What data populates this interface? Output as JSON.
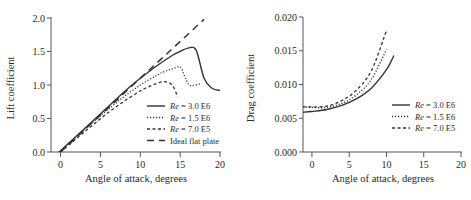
{
  "chart_data": [
    {
      "type": "line",
      "title": "",
      "xlabel": "Angle of attack, degrees",
      "ylabel": "Lift coefficient",
      "xlim": [
        -1.2,
        20
      ],
      "ylim": [
        0,
        2.0
      ],
      "xticks": [
        "0",
        "5",
        "10",
        "15",
        "20"
      ],
      "yticks": [
        "0.0",
        "0.5",
        "1.0",
        "1.5",
        "2.0"
      ],
      "grid": false,
      "legend_position": "lower right",
      "series": [
        {
          "name": "Re = 3.0 E6",
          "name_italic": "Re",
          "name_rest": " = 3.0 E6",
          "style": "solid",
          "x": [
            -1,
            0,
            2,
            4,
            6,
            8,
            10,
            12,
            14,
            15,
            16,
            17,
            18,
            19,
            20
          ],
          "y": [
            -0.1,
            0.02,
            0.24,
            0.46,
            0.68,
            0.9,
            1.1,
            1.28,
            1.44,
            1.5,
            1.55,
            1.52,
            1.1,
            0.95,
            0.92
          ]
        },
        {
          "name": "Re = 1.5 E6",
          "name_italic": "Re",
          "name_rest": " = 1.5 E6",
          "style": "dotted",
          "x": [
            -1,
            0,
            2,
            4,
            6,
            8,
            10,
            12,
            13,
            14,
            15,
            15.5,
            16,
            16.5,
            17.5
          ],
          "y": [
            -0.1,
            0.02,
            0.23,
            0.44,
            0.64,
            0.83,
            1.0,
            1.14,
            1.2,
            1.24,
            1.27,
            1.15,
            1.02,
            0.99,
            1.02
          ]
        },
        {
          "name": "Re = 7.0 E5",
          "name_italic": "Re",
          "name_rest": " = 7.0 E5",
          "style": "short-dashed",
          "x": [
            -1,
            0,
            2,
            4,
            6,
            8,
            10,
            11,
            12,
            13,
            14,
            14.7
          ],
          "y": [
            -0.12,
            0.0,
            0.2,
            0.4,
            0.59,
            0.76,
            0.91,
            0.97,
            1.02,
            1.05,
            1.0,
            0.82
          ]
        },
        {
          "name": "Ideal flat plate",
          "style": "long-dashed",
          "x": [
            0,
            18
          ],
          "y": [
            0.0,
            1.98
          ]
        }
      ]
    },
    {
      "type": "line",
      "title": "",
      "xlabel": "Angle of attack, degrees",
      "ylabel": "Drag coefficient",
      "xlim": [
        -1.2,
        20
      ],
      "ylim": [
        0,
        0.02
      ],
      "xticks": [
        "0",
        "5",
        "10",
        "15",
        "20"
      ],
      "yticks": [
        "0.000",
        "0.005",
        "0.010",
        "0.015",
        "0.020"
      ],
      "grid": false,
      "legend_position": "center right",
      "series": [
        {
          "name": "Re = 3.0 E6",
          "name_italic": "Re",
          "name_rest": " = 3.0 E6",
          "style": "solid",
          "x": [
            -1.2,
            0,
            2,
            4,
            6,
            8,
            10,
            11
          ],
          "y": [
            0.0059,
            0.006,
            0.0063,
            0.0069,
            0.0079,
            0.0095,
            0.0122,
            0.0143
          ]
        },
        {
          "name": "Re = 1.5 E6",
          "name_italic": "Re",
          "name_rest": " = 1.5 E6",
          "style": "dotted",
          "x": [
            -1.2,
            0,
            2,
            4,
            6,
            8,
            10
          ],
          "y": [
            0.0067,
            0.0066,
            0.0066,
            0.0072,
            0.0085,
            0.0108,
            0.0152
          ]
        },
        {
          "name": "Re = 7.0 E5",
          "name_italic": "Re",
          "name_rest": " = 7.0 E5",
          "style": "short-dashed",
          "x": [
            -1.2,
            0,
            2,
            4,
            6,
            8,
            10
          ],
          "y": [
            0.0067,
            0.0067,
            0.0068,
            0.0076,
            0.0092,
            0.0121,
            0.018
          ]
        }
      ]
    }
  ]
}
